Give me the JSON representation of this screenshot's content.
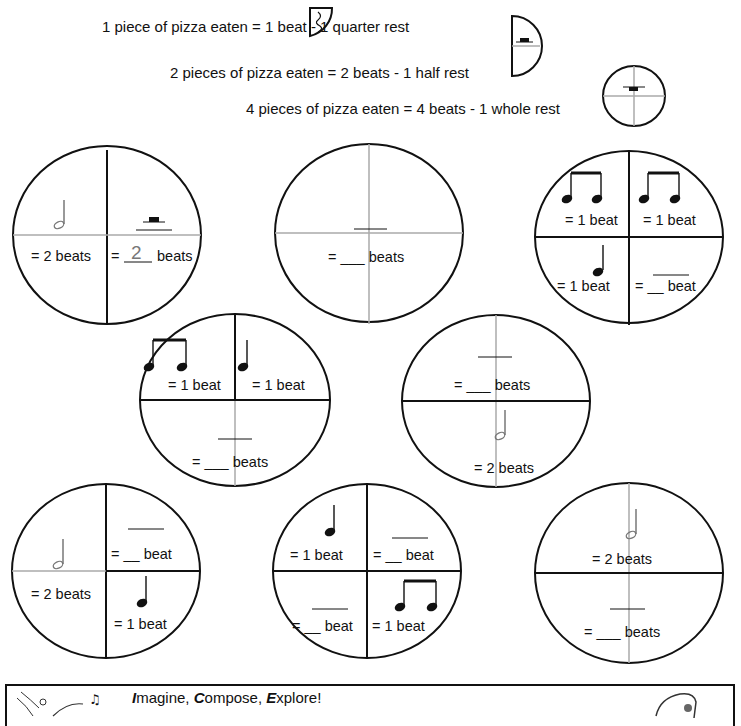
{
  "legend": {
    "quarter": "1 piece of pizza eaten = 1 beat - 1 quarter rest",
    "half": "2 pieces of pizza eaten = 2 beats - 1 half rest",
    "whole": "4 pieces of pizza eaten = 4 beats - 1 whole rest"
  },
  "pizzas": [
    {
      "id": 1,
      "q_tl": "= 2 beats",
      "q_tr_prefix": "=",
      "q_tr_answer": "2",
      "q_tr_suffix": "beats"
    },
    {
      "id": 2,
      "label": "= ___ beats"
    },
    {
      "id": 3,
      "q_tl": "= 1 beat",
      "q_tr": "= 1 beat",
      "q_bl": "= 1 beat",
      "q_br": "= __ beat"
    },
    {
      "id": 4,
      "q_tl": "= 1 beat",
      "q_tr": "= 1 beat",
      "bottom": "= ___ beats"
    },
    {
      "id": 5,
      "top": "= ___ beats",
      "bottom": "= 2 beats"
    },
    {
      "id": 6,
      "q_tl": "= 2 beats",
      "q_tr": "= __ beat",
      "q_br": "= 1 beat"
    },
    {
      "id": 7,
      "q_tl": "= 1 beat",
      "q_tr": "= __ beat",
      "q_bl": "= __ beat",
      "q_br": "= 1 beat"
    },
    {
      "id": 8,
      "top": "= 2 beats",
      "bottom": "= ___ beats"
    }
  ],
  "footer": {
    "title_i": "I",
    "title_1": "magine, ",
    "title_c": "C",
    "title_2": "ompose, ",
    "title_e": "E",
    "title_3": "xplore!"
  }
}
